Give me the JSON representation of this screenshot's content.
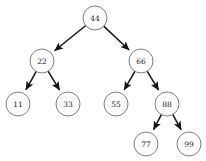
{
  "figure": {
    "background_color": "#ffffff",
    "node_fill_color": "#fdfdfd",
    "node_stroke_color": "#707070",
    "edge_color": "#141414",
    "label_color": "#1a1a1a",
    "node_radius": 12,
    "width": 206,
    "height": 161
  },
  "chart_data": {
    "type": "diagram",
    "diagram_kind": "binary-search-tree",
    "title": "",
    "directed": true,
    "arrowheads": "parent-to-child",
    "nodes": [
      {
        "id": "n44",
        "label": "44",
        "x": 95,
        "y": 18,
        "r": 12,
        "level": 0
      },
      {
        "id": "n22",
        "label": "22",
        "x": 42,
        "y": 61,
        "r": 12,
        "level": 1
      },
      {
        "id": "n66",
        "label": "66",
        "x": 141,
        "y": 61,
        "r": 12,
        "level": 1
      },
      {
        "id": "n11",
        "label": "11",
        "x": 18,
        "y": 104,
        "r": 12,
        "level": 2
      },
      {
        "id": "n33",
        "label": "33",
        "x": 68,
        "y": 104,
        "r": 12,
        "level": 2
      },
      {
        "id": "n55",
        "label": "55",
        "x": 116,
        "y": 104,
        "r": 12,
        "level": 2
      },
      {
        "id": "n88",
        "label": "88",
        "x": 167,
        "y": 104,
        "r": 12,
        "level": 2
      },
      {
        "id": "n77",
        "label": "77",
        "x": 146,
        "y": 144,
        "r": 12,
        "level": 3
      },
      {
        "id": "n99",
        "label": "99",
        "x": 189,
        "y": 144,
        "r": 12,
        "level": 3
      }
    ],
    "edges": [
      {
        "from": "n44",
        "to": "n22",
        "side": "left"
      },
      {
        "from": "n44",
        "to": "n66",
        "side": "right"
      },
      {
        "from": "n22",
        "to": "n11",
        "side": "left"
      },
      {
        "from": "n22",
        "to": "n33",
        "side": "right"
      },
      {
        "from": "n66",
        "to": "n55",
        "side": "left"
      },
      {
        "from": "n66",
        "to": "n88",
        "side": "right"
      },
      {
        "from": "n88",
        "to": "n77",
        "side": "left"
      },
      {
        "from": "n88",
        "to": "n99",
        "side": "right"
      }
    ],
    "values": [
      44,
      22,
      66,
      11,
      33,
      55,
      88,
      77,
      99
    ],
    "root": "44",
    "inorder": [
      11,
      22,
      33,
      44,
      55,
      66,
      77,
      88,
      99
    ]
  }
}
